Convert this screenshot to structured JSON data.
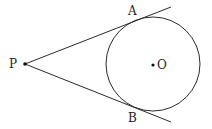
{
  "diagram": {
    "title": "",
    "points": {
      "P": {
        "label": "P",
        "x": 25,
        "y": 64
      },
      "O": {
        "label": "O",
        "x": 153,
        "y": 65
      },
      "A": {
        "label": "A",
        "x": 136,
        "y": 20
      },
      "B": {
        "label": "B",
        "x": 135,
        "y": 109
      }
    },
    "circle": {
      "center": "O",
      "radius": 47
    },
    "segments": [
      {
        "from": "P",
        "through": "A",
        "to_x": 171,
        "to_y": 7,
        "name": "tangent-PA"
      },
      {
        "from": "P",
        "through": "B",
        "to_x": 171,
        "to_y": 122,
        "name": "tangent-PB"
      }
    ],
    "colors": {
      "stroke": "#2a2a2a",
      "text": "#222222",
      "background": "#ffffff"
    }
  }
}
